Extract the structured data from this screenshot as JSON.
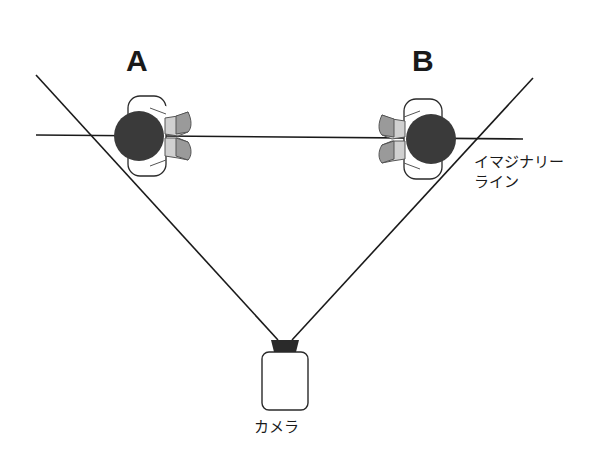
{
  "diagram": {
    "subjects": [
      {
        "id": "A",
        "label": "A",
        "facing": "right"
      },
      {
        "id": "B",
        "label": "B",
        "facing": "left"
      }
    ],
    "imaginary_line": {
      "label_line1": "イマジナリー",
      "label_line2": "ライン"
    },
    "camera": {
      "label": "カメラ"
    },
    "colors": {
      "line": "#1a1a1a",
      "head": "#3a3a3a",
      "arm_dark": "#9a9a9a",
      "arm_light": "#d0d0d0",
      "body_outline": "#2a2a2a"
    }
  }
}
